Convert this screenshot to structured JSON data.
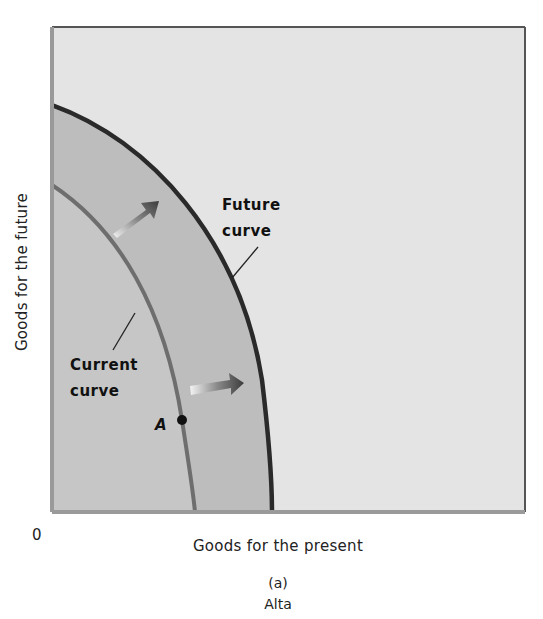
{
  "diagram": {
    "type": "production-possibilities-frontier",
    "panel_label": "(a)",
    "caption": "Alta",
    "axes": {
      "x_label": "Goods for the present",
      "y_label": "Goods for the future",
      "origin": "0"
    },
    "curves": [
      {
        "name": "current",
        "label_line1": "Current",
        "label_line2": "curve",
        "color": "#6e6e6e"
      },
      {
        "name": "future",
        "label_line1": "Future",
        "label_line2": "curve",
        "color": "#2a2a2a"
      }
    ],
    "point": {
      "label": "A",
      "on_curve": "current"
    },
    "arrows": [
      {
        "name": "shift-arrow-upper",
        "direction": "outward"
      },
      {
        "name": "shift-arrow-lower",
        "direction": "outward"
      }
    ],
    "colors": {
      "background_outside": "#e4e4e4",
      "inside_current": "#c6c6c6",
      "band_between": "#bcbcbc",
      "frame": "#555555"
    }
  }
}
